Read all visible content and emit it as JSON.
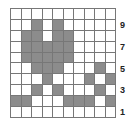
{
  "grid": {
    "rows": 10,
    "cols": 10,
    "shaded_color": "#8c8c8c",
    "cells": [
      [
        0,
        0,
        0,
        0,
        0,
        0,
        0,
        0,
        0,
        0
      ],
      [
        0,
        0,
        1,
        0,
        1,
        0,
        0,
        0,
        0,
        0
      ],
      [
        0,
        1,
        1,
        0,
        1,
        1,
        0,
        0,
        0,
        0
      ],
      [
        0,
        1,
        1,
        1,
        1,
        1,
        0,
        0,
        0,
        0
      ],
      [
        0,
        1,
        1,
        1,
        1,
        1,
        0,
        0,
        0,
        0
      ],
      [
        0,
        0,
        1,
        1,
        1,
        0,
        0,
        0,
        1,
        0
      ],
      [
        0,
        0,
        0,
        1,
        0,
        0,
        0,
        1,
        0,
        1
      ],
      [
        0,
        0,
        1,
        0,
        1,
        0,
        0,
        0,
        1,
        0
      ],
      [
        1,
        1,
        0,
        0,
        0,
        1,
        1,
        1,
        0,
        1
      ],
      [
        0,
        0,
        0,
        0,
        0,
        0,
        0,
        0,
        0,
        0
      ]
    ]
  },
  "row_labels": [
    {
      "row": 1,
      "text": "9"
    },
    {
      "row": 3,
      "text": "7"
    },
    {
      "row": 5,
      "text": "5"
    },
    {
      "row": 7,
      "text": "3"
    },
    {
      "row": 9,
      "text": "1"
    }
  ]
}
